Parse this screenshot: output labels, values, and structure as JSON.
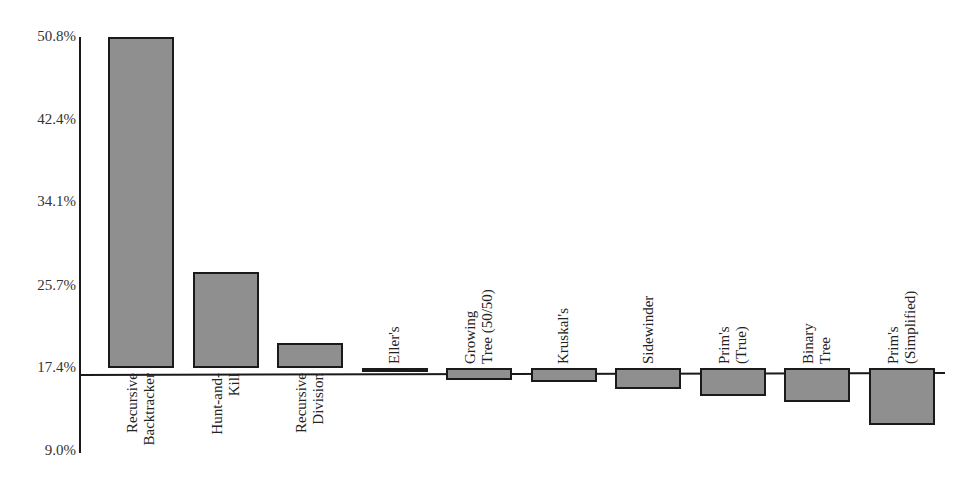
{
  "chart_data": {
    "type": "bar",
    "title": "",
    "xlabel": "",
    "ylabel": "",
    "baseline": 17.4,
    "ylim": [
      9.0,
      50.8
    ],
    "yticks": [
      "50.8%",
      "42.4%",
      "34.1%",
      "25.7%",
      "17.4%",
      "9.0%"
    ],
    "ytick_values": [
      50.8,
      42.4,
      34.1,
      25.7,
      17.4,
      9.0
    ],
    "grid": false,
    "legend": null,
    "categories": [
      "Recursive\nBacktracker",
      "Hunt-and-\nKill",
      "Recursive\nDivision",
      "Eller's",
      "Growing\nTree (50/50)",
      "Kruskal's",
      "Sidewinder",
      "Prim's\n(True)",
      "Binary\nTree",
      "Prim's\n(Simplified)"
    ],
    "values": [
      50.8,
      27.1,
      19.9,
      17.2,
      16.2,
      16.0,
      15.3,
      14.6,
      13.9,
      11.6
    ],
    "bar_color": "#8f8f8f",
    "edge_color": "#1a1a1a"
  }
}
